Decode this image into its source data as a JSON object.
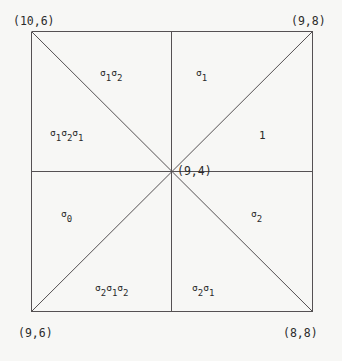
{
  "figure": {
    "background_color": "#f7f7f5",
    "line_color": "#555153",
    "text_color": "#2b2b2b",
    "square": {
      "left": 31,
      "top": 31,
      "right": 312,
      "bottom": 311
    },
    "center_point": {
      "x": 172,
      "y": 172
    }
  },
  "corner_labels": {
    "top_left": "(10,6)",
    "top_right": "(9,8)",
    "bottom_left": "(9,6)",
    "bottom_right": "(8,8)"
  },
  "center_label": "(9,4)",
  "regions": [
    {
      "name": "upper-left-upper",
      "text": "σ₁σ₂"
    },
    {
      "name": "upper-right-upper",
      "text": "σ₁"
    },
    {
      "name": "upper-left-lower",
      "text": "σ₁σ₂σ₁"
    },
    {
      "name": "upper-right-lower",
      "text": "1"
    },
    {
      "name": "lower-left-upper",
      "text": "σ₀"
    },
    {
      "name": "lower-right-upper",
      "text": "σ₂"
    },
    {
      "name": "lower-left-lower",
      "text": "σ₂σ₁σ₂"
    },
    {
      "name": "lower-right-lower",
      "text": "σ₂σ₁"
    }
  ],
  "chart_data": {
    "type": "diagram",
    "title": "",
    "vertices": [
      {
        "label": "(10,6)",
        "position": "top-left",
        "x": 31,
        "y": 31
      },
      {
        "label": "(9,8)",
        "position": "top-right",
        "x": 312,
        "y": 31
      },
      {
        "label": "(9,6)",
        "position": "bottom-left",
        "x": 31,
        "y": 311
      },
      {
        "label": "(8,8)",
        "position": "bottom-right",
        "x": 312,
        "y": 311
      },
      {
        "label": "(9,4)",
        "position": "center",
        "x": 172,
        "y": 172
      }
    ],
    "edges": [
      {
        "from": "top-left",
        "to": "top-right",
        "kind": "border"
      },
      {
        "from": "top-right",
        "to": "bottom-right",
        "kind": "border"
      },
      {
        "from": "bottom-right",
        "to": "bottom-left",
        "kind": "border"
      },
      {
        "from": "bottom-left",
        "to": "top-left",
        "kind": "border"
      },
      {
        "from": "top-left",
        "to": "bottom-right",
        "kind": "diagonal"
      },
      {
        "from": "top-right",
        "to": "bottom-left",
        "kind": "diagonal"
      },
      {
        "from": "mid-left",
        "to": "mid-right",
        "kind": "midline-horizontal"
      },
      {
        "from": "mid-top",
        "to": "mid-bottom",
        "kind": "midline-vertical"
      }
    ],
    "chamber_labels": [
      {
        "chamber": "N-W",
        "label": "σ₁σ₂",
        "x": 113,
        "y": 75
      },
      {
        "chamber": "N-E",
        "label": "σ₁",
        "x": 203,
        "y": 75
      },
      {
        "chamber": "W-N",
        "label": "σ₁σ₂σ₁",
        "x": 82,
        "y": 135
      },
      {
        "chamber": "E-N",
        "label": "1",
        "x": 263,
        "y": 136
      },
      {
        "chamber": "W-S",
        "label": "σ₀",
        "x": 67,
        "y": 216
      },
      {
        "chamber": "E-S",
        "label": "σ₂",
        "x": 258,
        "y": 216
      },
      {
        "chamber": "S-W",
        "label": "σ₂σ₁σ₂",
        "x": 125,
        "y": 290
      },
      {
        "chamber": "S-E",
        "label": "σ₂σ₁",
        "x": 213,
        "y": 290
      }
    ]
  }
}
